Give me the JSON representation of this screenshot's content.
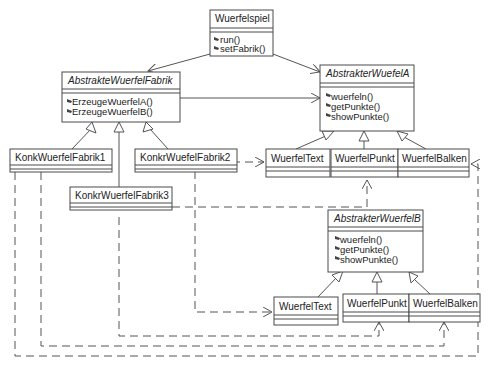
{
  "diagram": {
    "type": "UML class diagram (Abstract Factory)",
    "classes": {
      "wuerfelspiel": {
        "name": "Wuerfelspiel",
        "abstract": false,
        "operations": [
          "run()",
          "setFabrik()"
        ]
      },
      "abstrakteWuerfelFabrik": {
        "name": "AbstrakteWuerfelFabrik",
        "abstract": true,
        "operations": [
          "ErzeugeWuerfelA()",
          "ErzeugeWuerfelB()"
        ]
      },
      "abstrakterWuerfelA": {
        "name": "AbstrakterWuefelA",
        "abstract": true,
        "operations": [
          "wuerfeln()",
          "getPunkte()",
          "showPunkte()"
        ]
      },
      "abstrakterWuerfelB": {
        "name": "AbstrakterWuerfelB",
        "abstract": true,
        "operations": [
          "wuerfeln()",
          "getPunkte()",
          "showPunkte()"
        ]
      },
      "konkFabrik1": {
        "name": "KonkWuerfelFabrik1",
        "abstract": false,
        "operations": []
      },
      "konkFabrik2": {
        "name": "KonkrWuefelFabrik2",
        "abstract": false,
        "operations": []
      },
      "konkFabrik3": {
        "name": "KonkrWuerfelFabrik3",
        "abstract": false,
        "operations": []
      },
      "aText": {
        "name": "WuerfelText",
        "abstract": false,
        "operations": []
      },
      "aPunkt": {
        "name": "WuerfelPunkt",
        "abstract": false,
        "operations": []
      },
      "aBalken": {
        "name": "WuerfelBalken",
        "abstract": false,
        "operations": []
      },
      "bText": {
        "name": "WuerfelText",
        "abstract": false,
        "operations": []
      },
      "bPunkt": {
        "name": "WuerfelPunkt",
        "abstract": false,
        "operations": []
      },
      "bBalken": {
        "name": "WuerfelBalken",
        "abstract": false,
        "operations": []
      }
    },
    "relations": [
      {
        "from": "Wuerfelspiel",
        "to": "AbstrakteWuerfelFabrik",
        "kind": "association"
      },
      {
        "from": "Wuerfelspiel",
        "to": "AbstrakterWuefelA",
        "kind": "association"
      },
      {
        "from": "AbstrakteWuerfelFabrik",
        "to": "AbstrakterWuefelA",
        "kind": "association"
      },
      {
        "from": "KonkWuerfelFabrik1",
        "to": "AbstrakteWuerfelFabrik",
        "kind": "generalization"
      },
      {
        "from": "KonkrWuefelFabrik2",
        "to": "AbstrakteWuerfelFabrik",
        "kind": "generalization"
      },
      {
        "from": "KonkrWuerfelFabrik3",
        "to": "AbstrakteWuerfelFabrik",
        "kind": "generalization"
      },
      {
        "from": "WuerfelText (A)",
        "to": "AbstrakterWuefelA",
        "kind": "generalization"
      },
      {
        "from": "WuerfelPunkt (A)",
        "to": "AbstrakterWuefelA",
        "kind": "generalization"
      },
      {
        "from": "WuerfelBalken (A)",
        "to": "AbstrakterWuefelA",
        "kind": "generalization"
      },
      {
        "from": "WuerfelText (B)",
        "to": "AbstrakterWuerfelB",
        "kind": "generalization"
      },
      {
        "from": "WuerfelPunkt (B)",
        "to": "AbstrakterWuerfelB",
        "kind": "generalization"
      },
      {
        "from": "WuerfelBalken (B)",
        "to": "AbstrakterWuerfelB",
        "kind": "generalization"
      },
      {
        "from": "KonkrWuefelFabrik2",
        "to": "WuerfelText (A)",
        "kind": "dependency"
      },
      {
        "from": "KonkrWuefelFabrik2",
        "to": "WuerfelText (B)",
        "kind": "dependency"
      },
      {
        "from": "KonkrWuerfelFabrik3",
        "to": "WuerfelPunkt (A)",
        "kind": "dependency"
      },
      {
        "from": "KonkrWuerfelFabrik3",
        "to": "WuerfelPunkt (B)",
        "kind": "dependency"
      },
      {
        "from": "KonkWuerfelFabrik1",
        "to": "WuerfelBalken (A)",
        "kind": "dependency"
      },
      {
        "from": "KonkWuerfelFabrik1",
        "to": "WuerfelBalken (B)",
        "kind": "dependency"
      }
    ]
  }
}
